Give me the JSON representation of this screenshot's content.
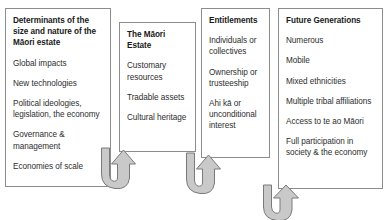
{
  "diagram": {
    "background_color": "#ffffff",
    "border_color": "#8c8c8c",
    "arrow_fill_color": "#c9c9c9",
    "arrow_stroke_color": "#7a7a7a",
    "heading_color": "#1a1a1a",
    "body_text_color": "#2e2e2e"
  },
  "panels": [
    {
      "id": "determinants",
      "title": "Determinants of the size and nature of the Māori estate",
      "items": [
        "Global impacts",
        "New technologies",
        "Political ideologies, legislation, the economy",
        "Governance & management",
        "Economies of scale"
      ]
    },
    {
      "id": "maori-estate",
      "title": "The Māori Estate",
      "items": [
        "Customary resources",
        "Tradable assets",
        "Cultural heritage"
      ]
    },
    {
      "id": "entitlements",
      "title": "Entitlements",
      "items": [
        "Individuals or collectives",
        "Ownership or trusteeship",
        "Ahi kā or unconditional interest"
      ]
    },
    {
      "id": "future-generations",
      "title": "Future Generations",
      "items": [
        "Numerous",
        "Mobile",
        "Mixed ethnicities",
        "Multiple tribal affiliations",
        "Access to te ao Māori",
        "Full participation in society & the economy"
      ]
    }
  ],
  "arrows": [
    {
      "id": "arrow-determinants-to-estate",
      "from": "determinants",
      "to": "maori-estate",
      "shape": "u-turn-up"
    },
    {
      "id": "arrow-estate-to-entitlements",
      "from": "maori-estate",
      "to": "entitlements",
      "shape": "u-turn-up"
    },
    {
      "id": "arrow-entitlements-to-future",
      "from": "entitlements",
      "to": "future-generations",
      "shape": "u-turn-up"
    }
  ]
}
